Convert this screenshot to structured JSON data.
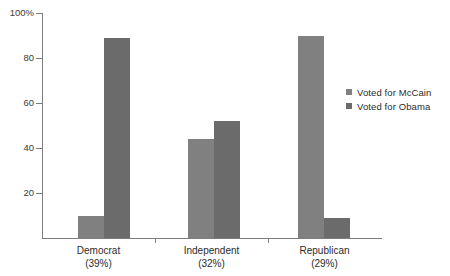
{
  "chart_data": {
    "type": "bar",
    "title": "",
    "subtitle": "",
    "xlabel": "",
    "ylabel": "",
    "grid": false,
    "legend_position": "right",
    "categories": [
      "Democrat",
      "Independent",
      "Republican"
    ],
    "category_sublabels": [
      "(39%)",
      "(32%)",
      "(29%)"
    ],
    "series": [
      {
        "name": "Voted for McCain",
        "color": "#808080",
        "values": [
          10,
          44,
          90
        ]
      },
      {
        "name": "Voted for Obama",
        "color": "#6b6b6b",
        "values": [
          89,
          52,
          9
        ]
      }
    ],
    "ylim": [
      0,
      100
    ],
    "yticks": [
      20,
      40,
      60,
      80,
      100
    ],
    "ytick_labels": [
      "20",
      "40",
      "60",
      "80",
      "100%"
    ],
    "axis_color": "#7d7d7d",
    "background": "#ffffff"
  },
  "legend": {
    "items": [
      {
        "label": "Voted for McCain",
        "color": "#808080"
      },
      {
        "label": "Voted for Obama",
        "color": "#6b6b6b"
      }
    ]
  },
  "axis": {
    "y_labels": [
      "100%",
      "80",
      "60",
      "40",
      "20"
    ],
    "x_labels": [
      "Democrat",
      "Independent",
      "Republican"
    ],
    "x_sublabels": [
      "(39%)",
      "(32%)",
      "(29%)"
    ]
  }
}
